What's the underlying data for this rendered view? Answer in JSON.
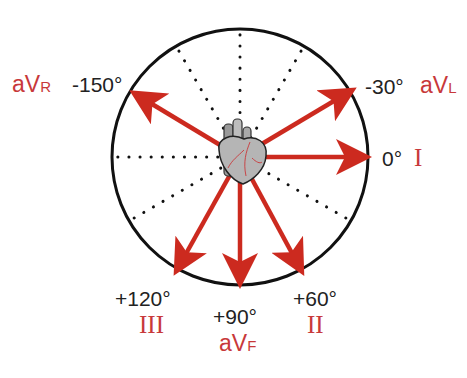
{
  "diagram": {
    "colors": {
      "arrow": "#cc2a1f",
      "circle": "#111111",
      "label_red": "#c8383a",
      "label_black": "#222222"
    },
    "center": [
      240,
      157
    ],
    "radius": 128,
    "leads": [
      {
        "id": "aVR",
        "name": "aV",
        "sub": "R",
        "angle": "-150°"
      },
      {
        "id": "aVL",
        "name": "aV",
        "sub": "L",
        "angle": "-30°"
      },
      {
        "id": "I",
        "name": "I",
        "angle": "0°"
      },
      {
        "id": "II",
        "name": "II",
        "angle": "+60°"
      },
      {
        "id": "aVF",
        "name": "aV",
        "sub": "F",
        "angle": "+90°"
      },
      {
        "id": "III",
        "name": "III",
        "angle": "+120°"
      }
    ],
    "center_icon": "heart-icon"
  }
}
